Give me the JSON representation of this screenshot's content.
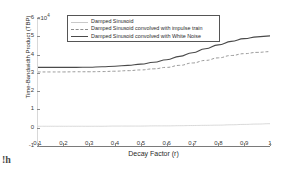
{
  "chart_data": {
    "type": "line",
    "title": "",
    "xlabel": "Decay Factor (r)",
    "ylabel": "Time-Bandwidth Product (TBP)",
    "y_exponent_label": "×10",
    "y_exponent_power": "4",
    "y_scale": 10000,
    "xlim": [
      0.1,
      1.0
    ],
    "ylim": [
      -1,
      6
    ],
    "xticks": [
      "0.1",
      "0.2",
      "0.3",
      "0.4",
      "0.5",
      "0.6",
      "0.7",
      "0.8",
      "0.9",
      "1"
    ],
    "xtick_values": [
      0.1,
      0.2,
      0.3,
      0.4,
      0.5,
      0.6,
      0.7,
      0.8,
      0.9,
      1.0
    ],
    "yticks": [
      "-1",
      "0",
      "1",
      "2",
      "3",
      "4",
      "5",
      "6"
    ],
    "ytick_values": [
      -1,
      0,
      1,
      2,
      3,
      4,
      5,
      6
    ],
    "grid": false,
    "legend_position": "upper center",
    "x": [
      0.1,
      0.15,
      0.2,
      0.25,
      0.3,
      0.35,
      0.4,
      0.45,
      0.5,
      0.55,
      0.6,
      0.65,
      0.7,
      0.75,
      0.8,
      0.85,
      0.9,
      0.95,
      1.0
    ],
    "series": [
      {
        "name": "Damped Sinusoid",
        "style": "solid",
        "color": "#c9c9c9",
        "values": [
          0.08,
          0.08,
          0.08,
          0.08,
          0.08,
          0.08,
          0.09,
          0.09,
          0.09,
          0.1,
          0.1,
          0.11,
          0.12,
          0.13,
          0.14,
          0.16,
          0.18,
          0.2,
          0.22
        ]
      },
      {
        "name": "Damped Sinusoid convolved with impulse train",
        "style": "dashed",
        "color": "#8e8e8e",
        "values": [
          3.05,
          3.05,
          3.05,
          3.06,
          3.06,
          3.07,
          3.09,
          3.12,
          3.16,
          3.22,
          3.3,
          3.41,
          3.54,
          3.68,
          3.82,
          3.95,
          4.05,
          4.12,
          4.16
        ]
      },
      {
        "name": "Damped Sinusoid convolved with White Noise",
        "style": "solid",
        "color": "#4a4a4a",
        "values": [
          3.3,
          3.3,
          3.3,
          3.3,
          3.31,
          3.33,
          3.36,
          3.41,
          3.48,
          3.58,
          3.72,
          3.9,
          4.1,
          4.32,
          4.53,
          4.72,
          4.87,
          4.97,
          5.02
        ]
      }
    ]
  },
  "legend": {
    "items": [
      "Damped Sinusoid",
      "Damped Sinusoid convolved with impulse train",
      "Damped Sinusoid convolved with White Noise"
    ]
  },
  "artifact": {
    "text": "!h"
  }
}
